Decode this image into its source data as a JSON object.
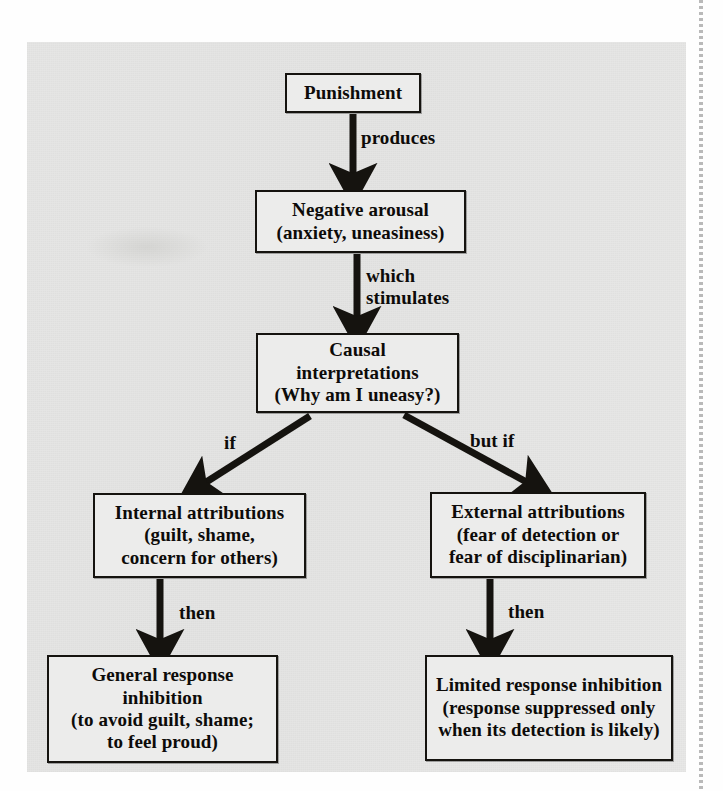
{
  "figure": {
    "kind": "flowchart",
    "orientation": "top-down",
    "panel_background": "#e6e6e5",
    "box_border_color": "#15130f",
    "text_color": "#0d0b09",
    "nodes": [
      {
        "id": "punishment",
        "text": "Punishment"
      },
      {
        "id": "arousal",
        "text": "Negative arousal\n(anxiety, uneasiness)"
      },
      {
        "id": "causal",
        "text": "Causal\ninterpretations\n(Why am I uneasy?)"
      },
      {
        "id": "internal",
        "text": "Internal attributions\n(guilt, shame,\nconcern for others)"
      },
      {
        "id": "external",
        "text": "External attributions\n(fear of detection or\nfear of disciplinarian)"
      },
      {
        "id": "general",
        "text": "General response inhibition\n(to avoid guilt, shame;\nto feel proud)"
      },
      {
        "id": "limited",
        "text": "Limited response inhibition\n(response suppressed only\nwhen its detection is likely)"
      }
    ],
    "edges": [
      {
        "from": "punishment",
        "to": "arousal",
        "label": "produces"
      },
      {
        "from": "arousal",
        "to": "causal",
        "label": "which\nstimulates"
      },
      {
        "from": "causal",
        "to": "internal",
        "label": "if"
      },
      {
        "from": "causal",
        "to": "external",
        "label": "but if"
      },
      {
        "from": "internal",
        "to": "general",
        "label": "then"
      },
      {
        "from": "external",
        "to": "limited",
        "label": "then"
      }
    ]
  }
}
